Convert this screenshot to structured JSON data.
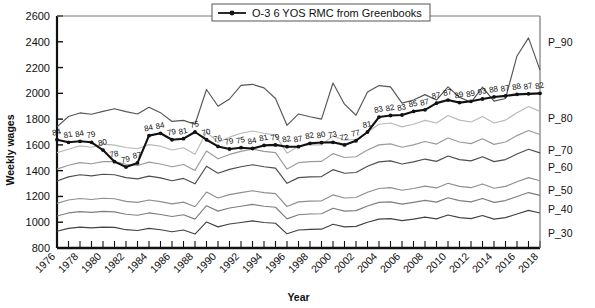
{
  "chart_data": {
    "type": "line",
    "title": "",
    "xlabel": "Year",
    "ylabel": "Weekly wages",
    "ylim": [
      800,
      2600
    ],
    "ytick_step": 200,
    "yticks": [
      800,
      1000,
      1200,
      1400,
      1600,
      1800,
      2000,
      2200,
      2400,
      2600
    ],
    "xlim": [
      1976,
      2018
    ],
    "xticks": [
      1976,
      1978,
      1980,
      1982,
      1984,
      1986,
      1988,
      1990,
      1992,
      1994,
      1996,
      1998,
      2000,
      2002,
      2004,
      2006,
      2008,
      2010,
      2012,
      2014,
      2016,
      2018
    ],
    "x": [
      1976,
      1977,
      1978,
      1979,
      1980,
      1981,
      1982,
      1983,
      1984,
      1985,
      1986,
      1987,
      1988,
      1989,
      1990,
      1991,
      1992,
      1993,
      1994,
      1995,
      1996,
      1997,
      1998,
      1999,
      2000,
      2001,
      2002,
      2003,
      2004,
      2005,
      2006,
      2007,
      2008,
      2009,
      2010,
      2011,
      2012,
      2013,
      2014,
      2015,
      2016,
      2017,
      2018
    ],
    "grid": false,
    "legend_position": "top-center",
    "legend": [
      "O-3 6 YOS RMC from Greenbooks"
    ],
    "annotations_note": "Numbers above the bold series are the percentile rank of O-3 6 YOS RMC within the civilian wage distribution.",
    "series": [
      {
        "name": "O-3 6 YOS RMC from Greenbooks",
        "style": "bold-black-marker",
        "color": "#111111",
        "values": [
          1640,
          1620,
          1628,
          1620,
          1560,
          1470,
          1428,
          1460,
          1672,
          1690,
          1640,
          1648,
          1700,
          1640,
          1588,
          1568,
          1578,
          1572,
          1596,
          1600,
          1586,
          1586,
          1612,
          1618,
          1620,
          1600,
          1632,
          1700,
          1816,
          1828,
          1832,
          1860,
          1872,
          1924,
          1948,
          1928,
          1938,
          1956,
          1972,
          1980,
          1992,
          1996,
          2000
        ],
        "data_labels": [
          84,
          81,
          84,
          79,
          80,
          78,
          79,
          87,
          84,
          84,
          79,
          81,
          75,
          70,
          76,
          79,
          75,
          84,
          81,
          79,
          82,
          87,
          82,
          80,
          73,
          72,
          77,
          81,
          83,
          82,
          83,
          85,
          87,
          87,
          87,
          89,
          89,
          93,
          88,
          87,
          88,
          87,
          82,
          85
        ]
      },
      {
        "name": "P_90",
        "style": "thin-dark-gray",
        "color": "#555555",
        "label": "P_90",
        "values": [
          1740,
          1820,
          1848,
          1838,
          1860,
          1880,
          1858,
          1840,
          1892,
          1850,
          1782,
          1790,
          1760,
          2030,
          1900,
          1956,
          2062,
          2070,
          2042,
          1960,
          1752,
          1840,
          1818,
          1800,
          2080,
          1916,
          1830,
          2010,
          2060,
          2050,
          1924,
          1948,
          1990,
          1948,
          2050,
          1970,
          1930,
          2048,
          1940,
          1960,
          2290,
          2430,
          2180
        ]
      },
      {
        "name": "P_80",
        "style": "thin-light-gray",
        "color": "#b9b9b9",
        "label": "P_80",
        "values": [
          1540,
          1566,
          1592,
          1582,
          1606,
          1598,
          1580,
          1570,
          1602,
          1590,
          1560,
          1578,
          1528,
          1700,
          1620,
          1660,
          1690,
          1708,
          1690,
          1676,
          1536,
          1590,
          1600,
          1600,
          1670,
          1636,
          1642,
          1700,
          1760,
          1770,
          1740,
          1760,
          1790,
          1770,
          1828,
          1792,
          1778,
          1820,
          1770,
          1792,
          1850,
          1898,
          1860
        ]
      },
      {
        "name": "P_70",
        "style": "thin-mid-gray",
        "color": "#9a9a9a",
        "label": "P_70",
        "values": [
          1412,
          1442,
          1462,
          1454,
          1470,
          1470,
          1450,
          1440,
          1466,
          1452,
          1430,
          1448,
          1402,
          1552,
          1492,
          1526,
          1550,
          1568,
          1550,
          1540,
          1412,
          1462,
          1470,
          1472,
          1532,
          1502,
          1508,
          1560,
          1600,
          1608,
          1582,
          1600,
          1626,
          1606,
          1654,
          1622,
          1610,
          1648,
          1604,
          1622,
          1672,
          1712,
          1680
        ]
      },
      {
        "name": "P_60",
        "style": "thin-dark-gray",
        "color": "#4e4e4e",
        "label": "P_60",
        "values": [
          1320,
          1352,
          1368,
          1360,
          1372,
          1368,
          1346,
          1336,
          1358,
          1344,
          1322,
          1340,
          1298,
          1434,
          1380,
          1410,
          1430,
          1446,
          1430,
          1420,
          1302,
          1346,
          1352,
          1354,
          1408,
          1380,
          1386,
          1434,
          1468,
          1476,
          1452,
          1468,
          1490,
          1472,
          1514,
          1486,
          1476,
          1508,
          1470,
          1486,
          1530,
          1566,
          1538
        ]
      },
      {
        "name": "P_50",
        "style": "thin-mid-gray",
        "color": "#8e8e8e",
        "label": "P_50",
        "values": [
          1146,
          1172,
          1184,
          1176,
          1186,
          1182,
          1162,
          1154,
          1172,
          1160,
          1142,
          1156,
          1120,
          1234,
          1188,
          1214,
          1230,
          1244,
          1230,
          1222,
          1122,
          1158,
          1164,
          1166,
          1212,
          1188,
          1192,
          1232,
          1262,
          1268,
          1248,
          1262,
          1280,
          1266,
          1302,
          1278,
          1268,
          1296,
          1264,
          1278,
          1314,
          1346,
          1322
        ]
      },
      {
        "name": "P_40",
        "style": "thin-mid-gray",
        "color": "#7e7e7e",
        "label": "P_40",
        "values": [
          1048,
          1072,
          1082,
          1076,
          1084,
          1080,
          1062,
          1054,
          1072,
          1060,
          1044,
          1058,
          1024,
          1128,
          1086,
          1110,
          1124,
          1138,
          1124,
          1116,
          1026,
          1058,
          1064,
          1066,
          1108,
          1086,
          1090,
          1126,
          1154,
          1158,
          1140,
          1154,
          1170,
          1156,
          1190,
          1168,
          1158,
          1184,
          1154,
          1168,
          1200,
          1230,
          1208
        ]
      },
      {
        "name": "P_30",
        "style": "thin-dark-gray",
        "color": "#444444",
        "label": "P_30",
        "values": [
          930,
          952,
          962,
          956,
          962,
          960,
          942,
          936,
          952,
          942,
          926,
          940,
          908,
          1002,
          964,
          986,
          998,
          1010,
          998,
          992,
          910,
          940,
          944,
          946,
          984,
          964,
          968,
          1000,
          1024,
          1028,
          1012,
          1024,
          1040,
          1026,
          1056,
          1036,
          1028,
          1052,
          1024,
          1036,
          1064,
          1092,
          1072
        ]
      }
    ]
  },
  "axis": {
    "ylabel": "Weekly wages",
    "xlabel": "Year"
  },
  "legend": {
    "entry_label": "O-3 6 YOS RMC from Greenbooks"
  },
  "percentile_labels": [
    "P_90",
    "P_80",
    "P_70",
    "P_60",
    "P_50",
    "P_40",
    "P_30"
  ]
}
